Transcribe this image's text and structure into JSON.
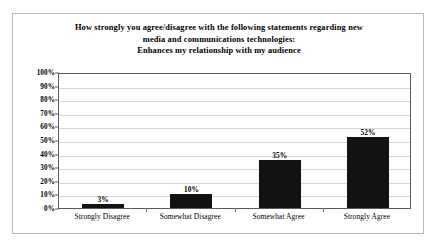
{
  "chart_data": {
    "type": "bar",
    "title": "How strongly you agree/disagree  with the following statements regarding new media and communications technologies: Enhances my relationship with my audience",
    "title_lines": [
      "How strongly you agree/disagree  with the following statements regarding new",
      "media and communications technologies:",
      "Enhances my relationship with my audience"
    ],
    "categories": [
      "Strongly Disagree",
      "Somewhat Disagree",
      "Somewhat Agree",
      "Strongly Agree"
    ],
    "values": [
      3,
      10,
      35,
      52
    ],
    "data_labels": [
      "3%",
      "10%",
      "35%",
      "52%"
    ],
    "xlabel": "",
    "ylabel": "",
    "ylim": [
      0,
      100
    ],
    "ytick_values": [
      0,
      10,
      20,
      30,
      40,
      50,
      60,
      70,
      80,
      90,
      100
    ],
    "ytick_labels": [
      "0%",
      "10%",
      "20%",
      "30%",
      "40%",
      "50%",
      "60%",
      "70%",
      "80%",
      "90%",
      "100%"
    ],
    "grid": true,
    "legend": "none",
    "bar_color": "#121212",
    "grid_color": "#d8d8d8",
    "axis_color": "#5b5b5b",
    "frame_color": "#b9b9b9",
    "text_color": "#000000"
  }
}
